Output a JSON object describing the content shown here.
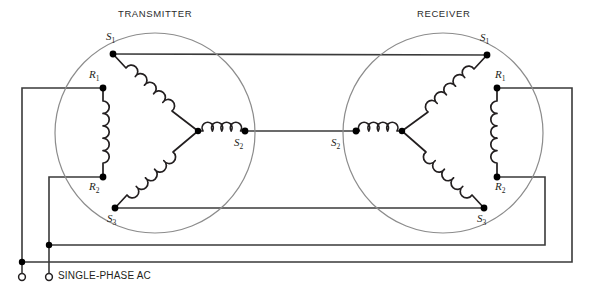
{
  "figure": {
    "type": "synchro-transmitter-receiver-wiring-diagram",
    "background": "#ffffff",
    "wire_color": "#333333",
    "machine_outline_color": "#8c8c8c",
    "node_color": "#000000"
  },
  "titles": {
    "transmitter": "TRANSMITTER",
    "receiver": "RECEIVER"
  },
  "source": {
    "label": "SINGLE-PHASE AC"
  },
  "transmitter": {
    "name": "TRANSMITTER",
    "stator_terminals": [
      {
        "id": "S1",
        "base": "S",
        "sub": "1"
      },
      {
        "id": "S2",
        "base": "S",
        "sub": "2"
      },
      {
        "id": "S3",
        "base": "S",
        "sub": "3"
      }
    ],
    "rotor_terminals": [
      {
        "id": "R1",
        "base": "R",
        "sub": "1"
      },
      {
        "id": "R2",
        "base": "R",
        "sub": "2"
      }
    ]
  },
  "receiver": {
    "name": "RECEIVER",
    "stator_terminals": [
      {
        "id": "S1",
        "base": "S",
        "sub": "1"
      },
      {
        "id": "S2",
        "base": "S",
        "sub": "2"
      },
      {
        "id": "S3",
        "base": "S",
        "sub": "3"
      }
    ],
    "rotor_terminals": [
      {
        "id": "R1",
        "base": "R",
        "sub": "1"
      },
      {
        "id": "R2",
        "base": "R",
        "sub": "2"
      }
    ]
  },
  "labels": {
    "tx_title": "TRANSMITTER",
    "rx_title": "RECEIVER",
    "tx_s1": "S",
    "tx_s1_sub": "1",
    "tx_s2": "S",
    "tx_s2_sub": "2",
    "tx_s3": "S",
    "tx_s3_sub": "3",
    "tx_r1": "R",
    "tx_r1_sub": "1",
    "tx_r2": "R",
    "tx_r2_sub": "2",
    "rx_s1": "S",
    "rx_s1_sub": "1",
    "rx_s2": "S",
    "rx_s2_sub": "2",
    "rx_s3": "S",
    "rx_s3_sub": "3",
    "rx_r1": "R",
    "rx_r1_sub": "1",
    "rx_r2": "R",
    "rx_r2_sub": "2",
    "ac": "SINGLE-PHASE AC"
  }
}
